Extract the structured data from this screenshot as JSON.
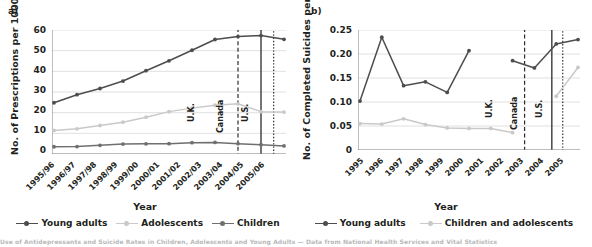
{
  "figure": {
    "panel_a_label": "a)",
    "panel_b_label": "b)",
    "caption_fragment": "Use of Antidepressants and Suicide Rates in Children, Adolescents and Young Adults — Data from National Health Services and Vital Statistics"
  },
  "colors": {
    "young_adults": "#4d4d4d",
    "adolescents": "#c9c9c9",
    "children": "#6f6f6f",
    "children_and_adolescents": "#c9c9c9",
    "grid": "#d8d8d8",
    "axis": "#8a8a8a",
    "text": "#231f20"
  },
  "chart_data": [
    {
      "type": "line",
      "panel": "a",
      "title": "",
      "xlabel": "Year",
      "ylabel": "No. of Prescriptions per 1000",
      "ylim": [
        0,
        60
      ],
      "yticks": [
        0,
        10,
        20,
        30,
        40,
        50,
        60
      ],
      "ytick_labels": [
        "0",
        "10",
        "20",
        "30",
        "40",
        "50",
        "60"
      ],
      "grid": true,
      "legend_position": "bottom",
      "categories": [
        "1995/96",
        "1996/97",
        "1997/98",
        "1998/99",
        "1999/00",
        "2000/01",
        "2001/02",
        "2002/03",
        "2003/04",
        "2004/05",
        "2005/06"
      ],
      "series": [
        {
          "name": "Young adults",
          "color": "#4d4d4d",
          "values": [
            24.8,
            28.7,
            31.7,
            35.3,
            40.3,
            45.1,
            50.2,
            55.4,
            56.8,
            57.3,
            55.5
          ]
        },
        {
          "name": "Adolescents",
          "color": "#c9c9c9",
          "values": [
            11.4,
            12.2,
            13.8,
            15.4,
            17.8,
            20.5,
            22.2,
            23.6,
            24.3,
            20.5,
            20.3
          ]
        },
        {
          "name": "Children",
          "color": "#6f6f6f",
          "values": [
            3.5,
            3.6,
            4.2,
            4.8,
            4.9,
            5.0,
            5.5,
            5.6,
            5.0,
            4.5,
            3.9
          ]
        }
      ],
      "markers": [
        {
          "label": "U.K.",
          "x_index": 8,
          "style": "dashed"
        },
        {
          "label": "Canada",
          "x_index": 9,
          "style": "solid"
        },
        {
          "label": "U.S.",
          "x_index": 9.55,
          "style": "dotted"
        }
      ]
    },
    {
      "type": "line",
      "panel": "b",
      "title": "",
      "xlabel": "Year",
      "ylabel": "No. of Completed Suicides per 1000",
      "ylim": [
        0,
        0.25
      ],
      "yticks": [
        0,
        0.05,
        0.1,
        0.15,
        0.2,
        0.25
      ],
      "ytick_labels": [
        "0",
        "0.05",
        "0.10",
        "0.15",
        "0.20",
        "0.25"
      ],
      "grid": true,
      "legend_position": "bottom",
      "categories": [
        "1995",
        "1996",
        "1997",
        "1998",
        "1999",
        "2000",
        "2001",
        "2002",
        "2003",
        "2004",
        "2005"
      ],
      "series": [
        {
          "name": "Young adults",
          "color": "#4d4d4d",
          "values": [
            0.102,
            0.235,
            0.134,
            0.142,
            0.12,
            0.207,
            null,
            0.186,
            0.171,
            0.221,
            0.23
          ]
        },
        {
          "name": "Children and adolescents",
          "color": "#c9c9c9",
          "values": [
            0.055,
            0.054,
            0.065,
            0.053,
            0.046,
            0.045,
            0.045,
            0.036,
            null,
            0.112,
            0.172
          ]
        }
      ],
      "markers": [
        {
          "label": "U.K.",
          "x_index": 7.55,
          "style": "dashed"
        },
        {
          "label": "Canada",
          "x_index": 8.8,
          "style": "solid"
        },
        {
          "label": "U.S.",
          "x_index": 9.3,
          "style": "dotted"
        }
      ]
    }
  ]
}
